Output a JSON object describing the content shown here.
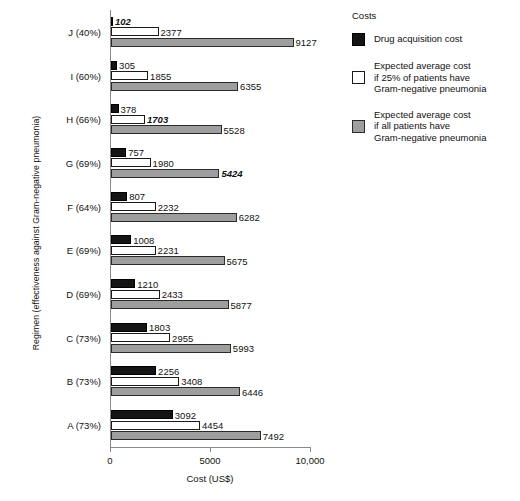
{
  "chart_data": {
    "type": "bar",
    "orientation": "horizontal",
    "title": "",
    "xlabel": "Cost (US$)",
    "ylabel": "Regimen (effectiveness against Gram-negative pneumonia)",
    "xlim": [
      0,
      10000
    ],
    "xticks": [
      0,
      5000,
      10000
    ],
    "xticklabels": [
      "0",
      "5000",
      "10,000"
    ],
    "grid": false,
    "legend_position": "right",
    "legend_title": "Costs",
    "categories": [
      "J (40%)",
      "I (60%)",
      "H (66%)",
      "G (69%)",
      "F (64%)",
      "E (69%)",
      "D (69%)",
      "C (73%)",
      "B (73%)",
      "A (73%)"
    ],
    "series": [
      {
        "name": "Drug acquisition cost",
        "color": "#141414",
        "values": [
          102,
          305,
          378,
          757,
          807,
          1008,
          1210,
          1803,
          2256,
          3092
        ],
        "emphasis": [
          true,
          false,
          false,
          false,
          false,
          false,
          false,
          false,
          false,
          false
        ]
      },
      {
        "name": "Expected average cost if 25% of patients have Gram-negative pneumonia",
        "color": "#ffffff",
        "values": [
          2377,
          1855,
          1703,
          1980,
          2232,
          2231,
          2433,
          2955,
          3408,
          4454
        ],
        "emphasis": [
          false,
          false,
          true,
          false,
          false,
          false,
          false,
          false,
          false,
          false
        ]
      },
      {
        "name": "Expected average cost if all patients have Gram-negative pneumonia",
        "color": "#9e9e9e",
        "values": [
          9127,
          6355,
          5528,
          5424,
          6282,
          5675,
          5877,
          5993,
          6446,
          7492
        ],
        "emphasis": [
          false,
          false,
          false,
          true,
          false,
          false,
          false,
          false,
          false,
          false
        ]
      }
    ]
  },
  "legend": {
    "title": "Costs",
    "entries": [
      {
        "swatch": "black",
        "lines": [
          "Drug acquisition cost"
        ]
      },
      {
        "swatch": "white",
        "lines": [
          "Expected average cost",
          "if 25% of patients have",
          "Gram-negative pneumonia"
        ]
      },
      {
        "swatch": "gray",
        "lines": [
          "Expected average cost",
          "if all patients have",
          "Gram-negative pneumonia"
        ]
      }
    ]
  }
}
